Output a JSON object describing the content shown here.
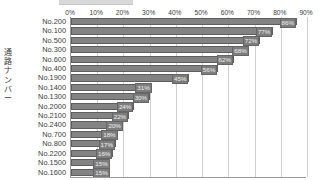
{
  "chart_data": {
    "type": "bar",
    "orientation": "horizontal",
    "title": "",
    "xlabel": "",
    "ylabel": "通路ナンバー",
    "xlim": [
      0,
      90
    ],
    "grid": true,
    "legend": "none",
    "bar_color": "#838383",
    "bar_edge_color": "#5e5e5e",
    "axis_color": "#9a9a9a",
    "gridline_color": "#cfcfcf",
    "text_color": "#3c3c3c",
    "value_label_color": "#f2f2f2",
    "xticks": [
      "0%",
      "10%",
      "20%",
      "30%",
      "40%",
      "50%",
      "60%",
      "70%",
      "80%",
      "90%"
    ],
    "xtick_values": [
      0,
      10,
      20,
      30,
      40,
      50,
      60,
      70,
      80,
      90
    ],
    "categories": [
      "No.200",
      "No.100",
      "No.500",
      "No.300",
      "No.600",
      "No.400",
      "No.1900",
      "No.1400",
      "No.1300",
      "No.2000",
      "No.2100",
      "No.2400",
      "No.700",
      "No.800",
      "No.2200",
      "No.1500",
      "No.1600"
    ],
    "values": [
      86,
      77,
      72,
      68,
      62,
      56,
      45,
      31,
      30,
      24,
      22,
      20,
      18,
      17,
      16,
      15,
      15
    ],
    "value_labels": [
      "86%",
      "77%",
      "72%",
      "68%",
      "62%",
      "56%",
      "45%",
      "31%",
      "30%",
      "24%",
      "22%",
      "20%",
      "18%",
      "17%",
      "16%",
      "15%",
      "15%"
    ]
  },
  "y_axis_title_chars": [
    "通",
    "路",
    "ナ",
    "ン",
    "バ",
    "ー"
  ]
}
